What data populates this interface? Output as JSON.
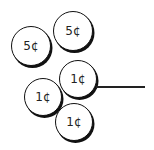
{
  "coins": [
    {
      "label": "5¢",
      "value_cents": 5,
      "cx": 31,
      "cy": 46,
      "r": 20
    },
    {
      "label": "5¢",
      "value_cents": 5,
      "cx": 73,
      "cy": 31,
      "r": 20
    },
    {
      "label": "1¢",
      "value_cents": 1,
      "cx": 78,
      "cy": 79,
      "r": 19
    },
    {
      "label": "1¢",
      "value_cents": 1,
      "cx": 43,
      "cy": 97,
      "r": 19
    },
    {
      "label": "1¢",
      "value_cents": 1,
      "cx": 74,
      "cy": 122,
      "r": 19
    }
  ],
  "answer_line": {
    "x1": 96,
    "x2": 145,
    "y": 86
  }
}
